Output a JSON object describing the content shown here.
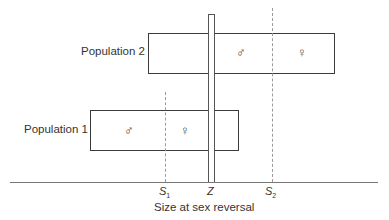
{
  "diagram": {
    "populations": [
      {
        "label": "Population 2",
        "male_symbol": "♂",
        "female_symbol": "♀"
      },
      {
        "label": "Population 1",
        "male_symbol": "♂",
        "female_symbol": "♀"
      }
    ],
    "axis": {
      "title": "Size at sex reversal",
      "ticks": [
        {
          "name": "S",
          "sub": "1"
        },
        {
          "name": "Z",
          "sub": ""
        },
        {
          "name": "S",
          "sub": "2"
        }
      ]
    },
    "colors": {
      "line": "#3a3a3a",
      "dashed": "#9a9a9a",
      "background": "#ffffff"
    }
  }
}
